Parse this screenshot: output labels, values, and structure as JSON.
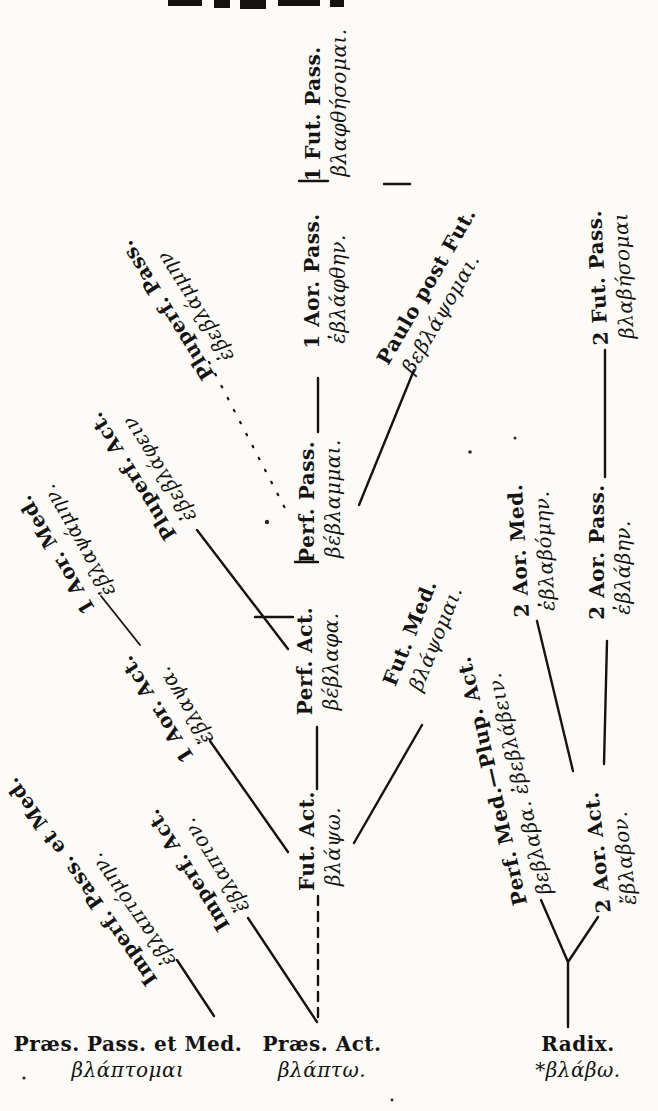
{
  "figure": {
    "kind": "greek-verb-derivation-tree",
    "ink_color": "#141311",
    "paper_color": "#fcfbf8"
  },
  "nodes": [
    {
      "id": "1-fut-pass",
      "label": "1 Fut. Pass.",
      "greek": "βλαφθήσομαι."
    },
    {
      "id": "1-aor-pass",
      "label": "1 Aor. Pass.",
      "greek": "ἐβλάφθην."
    },
    {
      "id": "perf-pass",
      "label": "Perf. Pass.",
      "greek": "βέβλαμμαι."
    },
    {
      "id": "perf-act",
      "label": "Perf. Act.",
      "greek": "βέβλαφα."
    },
    {
      "id": "fut-act",
      "label": "Fut. Act.",
      "greek": "βλάψω."
    },
    {
      "id": "praes-act",
      "label": "Præs. Act.",
      "greek": "βλάπτω."
    },
    {
      "id": "pluperf-pass",
      "label": "Pluperf. Pass.",
      "greek": "ἐβεβλάμμην"
    },
    {
      "id": "pluperf-act",
      "label": "Pluperf. Act.",
      "greek": "ἐβεβλάφειν"
    },
    {
      "id": "1-aor-med",
      "label": "1 Aor. Med.",
      "greek": "ἐβλαψάμην."
    },
    {
      "id": "1-aor-act",
      "label": "1 Aor. Act.",
      "greek": "ἔβλαψα."
    },
    {
      "id": "imperf-act",
      "label": "Imperf. Act.",
      "greek": "ἔβλαπτον."
    },
    {
      "id": "imperf-pass-med",
      "label": "Imperf. Pass. et Med.",
      "greek": "ἐβλαπτόμην."
    },
    {
      "id": "praes-pass-med",
      "label": "Præs. Pass. et Med.",
      "greek": "βλάπτομαι"
    },
    {
      "id": "paulo-post-fut",
      "label": "Paulo post Fut.",
      "greek": "βεβλάψομαι."
    },
    {
      "id": "2-fut-pass",
      "label": "2 Fut. Pass.",
      "greek": "βλαβήσομαι"
    },
    {
      "id": "2-aor-med",
      "label": "2 Aor. Med.",
      "greek": "ἐβλαβόμην."
    },
    {
      "id": "2-aor-pass",
      "label": "2 Aor. Pass.",
      "greek": "ἐβλάβην."
    },
    {
      "id": "fut-med",
      "label": "Fut. Med.",
      "greek": "βλάψομαι."
    },
    {
      "id": "perf-med-plup-act",
      "label": "Perf. Med.—Plup. Act.",
      "greek": "βεβλαβα.  ἐβεβλάβειν."
    },
    {
      "id": "2-aor-act",
      "label": "2 Aor. Act.",
      "greek": "ἔβλαβον."
    },
    {
      "id": "radix",
      "label": "Radix.",
      "greek": "*βλάβω."
    }
  ],
  "edges": [
    {
      "from": "praes-act",
      "to": "fut-act",
      "style": "dashed"
    },
    {
      "from": "praes-act",
      "to": "imperf-act",
      "style": "solid"
    },
    {
      "from": "praes-pass-med",
      "to": "imperf-pass-med",
      "style": "solid"
    },
    {
      "from": "fut-act",
      "to": "1-aor-act",
      "style": "solid"
    },
    {
      "from": "1-aor-act",
      "to": "1-aor-med",
      "style": "solid"
    },
    {
      "from": "fut-act",
      "to": "fut-med",
      "style": "solid"
    },
    {
      "from": "fut-act",
      "to": "perf-act",
      "style": "solid"
    },
    {
      "from": "perf-act",
      "to": "pluperf-act",
      "style": "solid"
    },
    {
      "from": "perf-act",
      "to": "perf-pass",
      "style": "solid"
    },
    {
      "from": "perf-pass",
      "to": "pluperf-pass",
      "style": "dotted"
    },
    {
      "from": "perf-pass",
      "to": "paulo-post-fut",
      "style": "solid"
    },
    {
      "from": "perf-pass",
      "to": "1-aor-pass",
      "style": "solid"
    },
    {
      "from": "1-aor-pass",
      "to": "1-fut-pass",
      "style": "solid"
    },
    {
      "from": "radix",
      "to": "perf-med-plup-act",
      "style": "solid"
    },
    {
      "from": "radix",
      "to": "2-aor-act",
      "style": "solid"
    },
    {
      "from": "2-aor-act",
      "to": "2-aor-med",
      "style": "solid"
    },
    {
      "from": "2-aor-act",
      "to": "2-aor-pass",
      "style": "solid"
    },
    {
      "from": "2-aor-pass",
      "to": "2-fut-pass",
      "style": "solid"
    }
  ]
}
